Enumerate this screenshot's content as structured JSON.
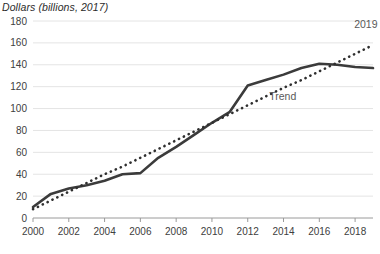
{
  "chart_data": {
    "type": "line",
    "title": "Dollars (billions, 2017)",
    "xlabel": "",
    "ylabel": "Dollars (billions, 2017)",
    "x": [
      2000,
      2001,
      2002,
      2003,
      2004,
      2005,
      2006,
      2007,
      2008,
      2009,
      2010,
      2011,
      2012,
      2013,
      2014,
      2015,
      2016,
      2017,
      2018,
      2019
    ],
    "xlim": [
      2000,
      2019
    ],
    "ylim": [
      0,
      180
    ],
    "y_ticks": [
      0,
      20,
      40,
      60,
      80,
      100,
      120,
      140,
      160,
      180
    ],
    "x_ticks": [
      2000,
      2002,
      2004,
      2006,
      2008,
      2010,
      2012,
      2014,
      2016,
      2018
    ],
    "grid": true,
    "legend_position": "inline-annotations",
    "series": [
      {
        "name": "Dollars",
        "style": "solid",
        "color": "#3b3b3b",
        "values": [
          10,
          22,
          27,
          30,
          34,
          40,
          41,
          55,
          65,
          76,
          87,
          97,
          121,
          126,
          131,
          137,
          141,
          140,
          138,
          137
        ]
      },
      {
        "name": "Trend",
        "style": "dotted",
        "color": "#2f2f2f",
        "values": [
          8,
          16,
          24,
          32,
          40,
          47,
          55,
          63,
          71,
          79,
          87,
          95,
          103,
          111,
          119,
          126,
          134,
          142,
          150,
          158
        ]
      }
    ],
    "annotations": [
      {
        "text": "Trend",
        "x": 2013.2,
        "y": 108,
        "color": "#595959"
      },
      {
        "text": "2019",
        "x": 2018.6,
        "y": 174,
        "color": "#595959"
      }
    ]
  }
}
